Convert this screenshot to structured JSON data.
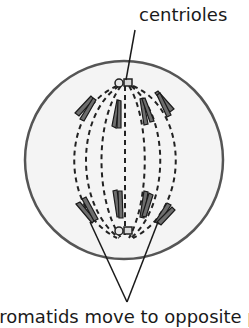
{
  "diagram": {
    "type": "cell-division-anaphase",
    "labels": {
      "top": "centrioles",
      "bottom": "chromatids move to opposite poles"
    },
    "colors": {
      "cell_fill": "#f2f2f2",
      "cell_stroke": "#555555",
      "chromatid_fill": "#707070",
      "outline": "#1a1a1a"
    }
  }
}
